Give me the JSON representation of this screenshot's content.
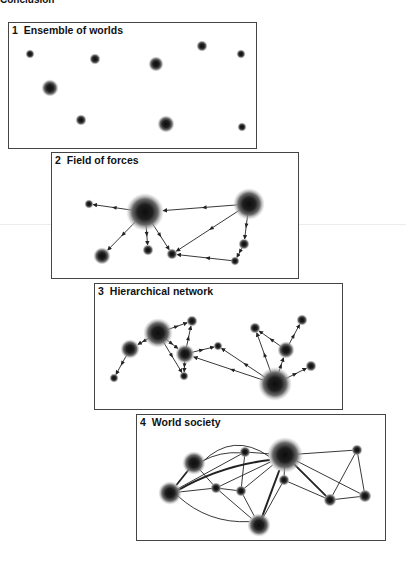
{
  "heading": "Conclusion",
  "panels": [
    {
      "number": "1",
      "title": "Ensemble of worlds",
      "box": {
        "x": 8,
        "y": 22,
        "w": 249,
        "h": 127
      },
      "nodes": [
        {
          "x": 30,
          "y": 54,
          "r": 3
        },
        {
          "x": 95,
          "y": 59,
          "r": 4
        },
        {
          "x": 156,
          "y": 64,
          "r": 6
        },
        {
          "x": 202,
          "y": 46,
          "r": 4
        },
        {
          "x": 241,
          "y": 54,
          "r": 3
        },
        {
          "x": 50,
          "y": 88,
          "r": 7
        },
        {
          "x": 81,
          "y": 120,
          "r": 4
        },
        {
          "x": 166,
          "y": 124,
          "r": 7
        },
        {
          "x": 242,
          "y": 127,
          "r": 3
        }
      ],
      "edges": []
    },
    {
      "number": "2",
      "title": "Field of forces",
      "box": {
        "x": 51,
        "y": 152,
        "w": 248,
        "h": 127
      },
      "nodes": [
        {
          "x": 89,
          "y": 204,
          "r": 3
        },
        {
          "x": 145,
          "y": 212,
          "r": 17
        },
        {
          "x": 249,
          "y": 204,
          "r": 14
        },
        {
          "x": 102,
          "y": 256,
          "r": 7
        },
        {
          "x": 148,
          "y": 250,
          "r": 4
        },
        {
          "x": 172,
          "y": 254,
          "r": 4
        },
        {
          "x": 244,
          "y": 244,
          "r": 4
        },
        {
          "x": 235,
          "y": 261,
          "r": 3
        }
      ],
      "edges": [
        {
          "from": 1,
          "to": 0,
          "arrow": true,
          "weight": 1
        },
        {
          "from": 2,
          "to": 1,
          "arrow": true,
          "weight": 1
        },
        {
          "from": 1,
          "to": 3,
          "arrow": true,
          "weight": 1
        },
        {
          "from": 1,
          "to": 4,
          "arrow": true,
          "weight": 1
        },
        {
          "from": 1,
          "to": 5,
          "arrow": true,
          "weight": 1
        },
        {
          "from": 2,
          "to": 5,
          "arrow": true,
          "weight": 1
        },
        {
          "from": 2,
          "to": 6,
          "arrow": true,
          "weight": 1
        },
        {
          "from": 6,
          "to": 7,
          "arrow": true,
          "weight": 1
        },
        {
          "from": 7,
          "to": 5,
          "arrow": true,
          "weight": 1
        }
      ]
    },
    {
      "number": "3",
      "title": "Hierarchical network",
      "box": {
        "x": 94,
        "y": 283,
        "w": 249,
        "h": 127
      },
      "nodes": [
        {
          "x": 158,
          "y": 333,
          "r": 13
        },
        {
          "x": 130,
          "y": 349,
          "r": 8
        },
        {
          "x": 114,
          "y": 378,
          "r": 3
        },
        {
          "x": 192,
          "y": 321,
          "r": 4
        },
        {
          "x": 185,
          "y": 354,
          "r": 8
        },
        {
          "x": 184,
          "y": 376,
          "r": 3
        },
        {
          "x": 218,
          "y": 346,
          "r": 3
        },
        {
          "x": 275,
          "y": 384,
          "r": 15
        },
        {
          "x": 255,
          "y": 328,
          "r": 4
        },
        {
          "x": 302,
          "y": 320,
          "r": 4
        },
        {
          "x": 286,
          "y": 350,
          "r": 7
        },
        {
          "x": 311,
          "y": 366,
          "r": 4
        }
      ],
      "edges": [
        {
          "from": 0,
          "to": 1,
          "arrow": true,
          "weight": 1
        },
        {
          "from": 1,
          "to": 2,
          "arrow": true,
          "weight": 1
        },
        {
          "from": 0,
          "to": 3,
          "arrow": true,
          "weight": 1
        },
        {
          "from": 0,
          "to": 4,
          "arrow": true,
          "weight": 1
        },
        {
          "from": 0,
          "to": 5,
          "arrow": true,
          "weight": 1
        },
        {
          "from": 4,
          "to": 3,
          "arrow": true,
          "weight": 1
        },
        {
          "from": 4,
          "to": 5,
          "arrow": true,
          "weight": 1
        },
        {
          "from": 4,
          "to": 6,
          "arrow": true,
          "weight": 1
        },
        {
          "from": 7,
          "to": 4,
          "arrow": true,
          "weight": 1
        },
        {
          "from": 7,
          "to": 6,
          "arrow": true,
          "weight": 1
        },
        {
          "from": 7,
          "to": 8,
          "arrow": true,
          "weight": 1
        },
        {
          "from": 7,
          "to": 10,
          "arrow": true,
          "weight": 1
        },
        {
          "from": 7,
          "to": 11,
          "arrow": true,
          "weight": 1
        },
        {
          "from": 10,
          "to": 8,
          "arrow": true,
          "weight": 1
        },
        {
          "from": 10,
          "to": 9,
          "arrow": true,
          "weight": 1
        }
      ]
    },
    {
      "number": "4",
      "title": "World society",
      "box": {
        "x": 136,
        "y": 414,
        "w": 250,
        "h": 127
      },
      "nodes": [
        {
          "x": 194,
          "y": 463,
          "r": 10
        },
        {
          "x": 170,
          "y": 493,
          "r": 10
        },
        {
          "x": 245,
          "y": 452,
          "r": 4
        },
        {
          "x": 216,
          "y": 488,
          "r": 4
        },
        {
          "x": 241,
          "y": 491,
          "r": 4
        },
        {
          "x": 259,
          "y": 525,
          "r": 10
        },
        {
          "x": 285,
          "y": 455,
          "r": 16
        },
        {
          "x": 284,
          "y": 480,
          "r": 4
        },
        {
          "x": 357,
          "y": 450,
          "r": 4
        },
        {
          "x": 330,
          "y": 500,
          "r": 5
        },
        {
          "x": 365,
          "y": 496,
          "r": 5
        }
      ],
      "edges": [
        {
          "from": 0,
          "to": 6,
          "arrow": false,
          "weight": 1,
          "curve": -28
        },
        {
          "from": 0,
          "to": 2,
          "arrow": false,
          "weight": 1,
          "curve": -6
        },
        {
          "from": 2,
          "to": 6,
          "arrow": false,
          "weight": 1
        },
        {
          "from": 0,
          "to": 1,
          "arrow": false,
          "weight": 2
        },
        {
          "from": 0,
          "to": 3,
          "arrow": false,
          "weight": 1
        },
        {
          "from": 1,
          "to": 6,
          "arrow": false,
          "weight": 2.2,
          "curve": -10
        },
        {
          "from": 1,
          "to": 3,
          "arrow": false,
          "weight": 1
        },
        {
          "from": 1,
          "to": 5,
          "arrow": false,
          "weight": 1,
          "curve": 16
        },
        {
          "from": 1,
          "to": 2,
          "arrow": false,
          "weight": 1
        },
        {
          "from": 3,
          "to": 4,
          "arrow": false,
          "weight": 1
        },
        {
          "from": 3,
          "to": 5,
          "arrow": false,
          "weight": 1
        },
        {
          "from": 3,
          "to": 6,
          "arrow": false,
          "weight": 1
        },
        {
          "from": 2,
          "to": 4,
          "arrow": false,
          "weight": 1
        },
        {
          "from": 4,
          "to": 5,
          "arrow": false,
          "weight": 1
        },
        {
          "from": 4,
          "to": 6,
          "arrow": false,
          "weight": 1
        },
        {
          "from": 5,
          "to": 6,
          "arrow": false,
          "weight": 2.2
        },
        {
          "from": 5,
          "to": 7,
          "arrow": false,
          "weight": 1
        },
        {
          "from": 6,
          "to": 7,
          "arrow": false,
          "weight": 1
        },
        {
          "from": 6,
          "to": 8,
          "arrow": false,
          "weight": 1
        },
        {
          "from": 6,
          "to": 9,
          "arrow": false,
          "weight": 2
        },
        {
          "from": 6,
          "to": 10,
          "arrow": false,
          "weight": 1
        },
        {
          "from": 7,
          "to": 9,
          "arrow": false,
          "weight": 1
        },
        {
          "from": 8,
          "to": 9,
          "arrow": false,
          "weight": 1
        },
        {
          "from": 8,
          "to": 10,
          "arrow": false,
          "weight": 1
        },
        {
          "from": 9,
          "to": 10,
          "arrow": false,
          "weight": 1
        }
      ]
    }
  ],
  "colors": {
    "node_core": "#111111",
    "node_halo": "#9a9a9a",
    "edge": "#222222",
    "frame": "#444444"
  }
}
